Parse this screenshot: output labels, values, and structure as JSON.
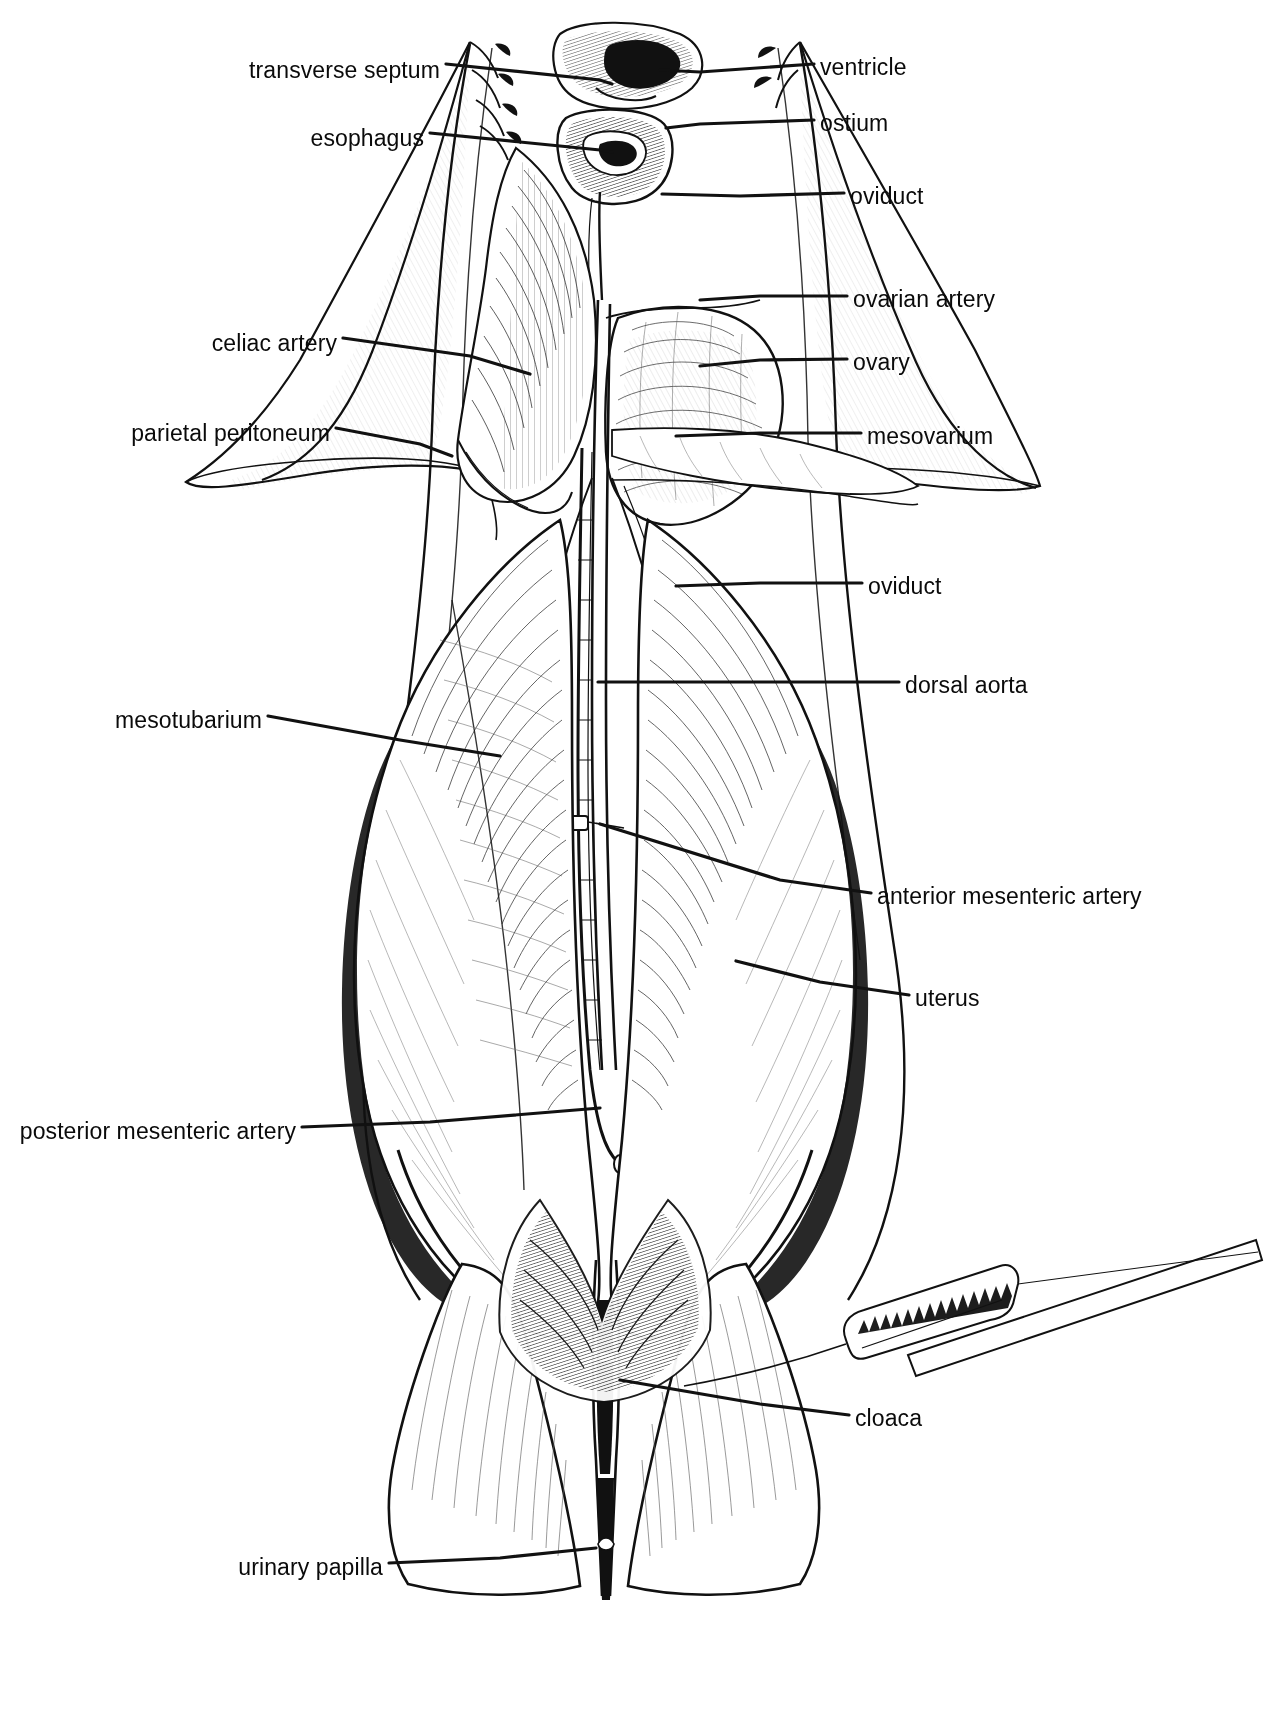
{
  "figure": {
    "kind": "anatomical-line-drawing",
    "style": "black and white pen-and-ink scientific illustration",
    "background_color": "#ffffff",
    "ink_color": "#111111"
  },
  "labels": [
    {
      "id": "transverse-septum",
      "text": "transverse septum",
      "side": "left",
      "x": 440,
      "y": 71,
      "leader": "M446,64 L600,80 L612,84"
    },
    {
      "id": "esophagus",
      "text": "esophagus",
      "side": "left",
      "x": 424,
      "y": 139,
      "leader": "M430,133 L600,150 L612,152"
    },
    {
      "id": "ventricle",
      "text": "ventricle",
      "side": "right",
      "x": 820,
      "y": 68,
      "leader": "M814,64 L700,72 L660,70"
    },
    {
      "id": "ostium",
      "text": "ostium",
      "side": "right",
      "x": 820,
      "y": 124,
      "leader": "M814,120 L700,124 L666,128"
    },
    {
      "id": "oviduct-upper",
      "text": "oviduct",
      "side": "right",
      "x": 850,
      "y": 197,
      "leader": "M844,193 L740,196 L662,194"
    },
    {
      "id": "ovarian-artery",
      "text": "ovarian artery",
      "side": "right",
      "x": 853,
      "y": 300,
      "leader": "M847,296 L760,296 L700,300"
    },
    {
      "id": "ovary",
      "text": "ovary",
      "side": "right",
      "x": 853,
      "y": 363,
      "leader": "M847,359 L760,360 L700,366"
    },
    {
      "id": "mesovarium",
      "text": "mesovarium",
      "side": "right",
      "x": 867,
      "y": 437,
      "leader": "M861,433 L760,433 L676,436"
    },
    {
      "id": "celiac-artery",
      "text": "celiac artery",
      "side": "left",
      "x": 337,
      "y": 344,
      "leader": "M343,338 L470,356 L530,374"
    },
    {
      "id": "parietal-peritoneum",
      "text": "parietal peritoneum",
      "side": "left",
      "x": 330,
      "y": 434,
      "leader": "M336,428 L420,444 L452,456"
    },
    {
      "id": "oviduct-lower",
      "text": "oviduct",
      "side": "right",
      "x": 868,
      "y": 587,
      "leader": "M862,583 L760,583 L676,586"
    },
    {
      "id": "dorsal-aorta",
      "text": "dorsal aorta",
      "side": "right",
      "x": 905,
      "y": 686,
      "leader": "M899,682 L780,682 L598,682"
    },
    {
      "id": "mesotubarium",
      "text": "mesotubarium",
      "side": "left",
      "x": 262,
      "y": 721,
      "leader": "M268,716 L400,740 L500,756"
    },
    {
      "id": "anterior-mesenteric-artery",
      "text": "anterior mesenteric artery",
      "side": "right",
      "x": 877,
      "y": 897,
      "leader": "M871,893 L780,880 L600,824"
    },
    {
      "id": "uterus",
      "text": "uterus",
      "side": "right",
      "x": 915,
      "y": 999,
      "leader": "M909,995 L820,982 L736,961"
    },
    {
      "id": "posterior-mesenteric-artery",
      "text": "posterior mesenteric artery",
      "side": "left",
      "x": 296,
      "y": 1132,
      "leader": "M302,1127 L430,1122 L600,1108"
    },
    {
      "id": "cloaca",
      "text": "cloaca",
      "side": "right",
      "x": 855,
      "y": 1419,
      "leader": "M849,1415 L760,1404 L620,1380"
    },
    {
      "id": "urinary-papilla",
      "text": "urinary papilla",
      "side": "left",
      "x": 383,
      "y": 1568,
      "leader": "M389,1563 L500,1558 L596,1548"
    }
  ],
  "structures": [
    {
      "id": "body-wall-flap-left",
      "name": "reflected left body wall flap"
    },
    {
      "id": "body-wall-flap-right",
      "name": "reflected right body wall flap"
    },
    {
      "id": "pericardial-region",
      "name": "pericardial cavity with ventricle"
    },
    {
      "id": "ovary-mass",
      "name": "ovary with follicles"
    },
    {
      "id": "uterus-left",
      "name": "left uterus / shell gland region"
    },
    {
      "id": "uterus-right",
      "name": "right uterus / shell gland region"
    },
    {
      "id": "aorta-strand",
      "name": "dorsal aorta running mid-line"
    },
    {
      "id": "pelvic-fins",
      "name": "pelvic fins flanking cloaca"
    },
    {
      "id": "probe",
      "name": "bristled probe inserted toward cloaca"
    }
  ]
}
